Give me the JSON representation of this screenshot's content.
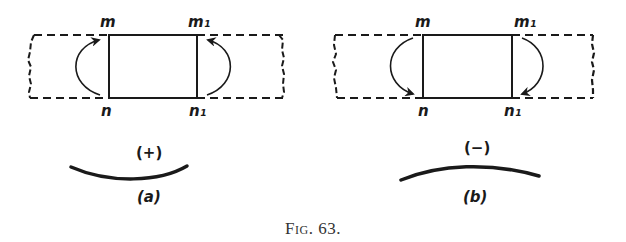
{
  "figure": {
    "caption": "Fig. 63.",
    "ink_color": "#1a1a1a",
    "background": "#ffffff"
  },
  "panels": [
    {
      "id": "a",
      "label": "(a)",
      "sign": "(+)",
      "corners": {
        "top_left": "m",
        "top_right": "m₁",
        "bottom_left": "n",
        "bottom_right": "n₁"
      },
      "arrow_direction": "upward (toward m and m₁)",
      "curvature": "concave up (sagging)"
    },
    {
      "id": "b",
      "label": "(b)",
      "sign": "(−)",
      "corners": {
        "top_left": "m",
        "top_right": "m₁",
        "bottom_left": "n",
        "bottom_right": "n₁"
      },
      "arrow_direction": "downward (toward n and n₁)",
      "curvature": "concave down (hogging)"
    }
  ]
}
